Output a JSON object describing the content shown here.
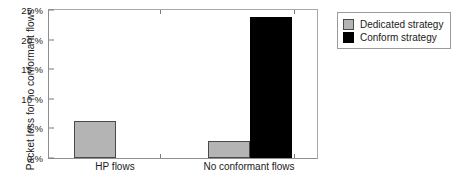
{
  "chart_data": {
    "type": "bar",
    "title": "",
    "xlabel": "",
    "ylabel": "Packet loss for no conformant flows",
    "categories": [
      "HP flows",
      "No conformant flows"
    ],
    "series": [
      {
        "name": "Dedicated strategy",
        "color": "#b4b4b4",
        "values": [
          6.2,
          2.9
        ]
      },
      {
        "name": "Conform strategy",
        "color": "#000000",
        "values": [
          null,
          23.8
        ]
      }
    ],
    "ylim": [
      0,
      25
    ],
    "ytick_values": [
      0,
      5,
      10,
      15,
      20,
      25
    ],
    "ytick_labels": [
      "0 %",
      "5 %",
      "10 %",
      "15 %",
      "20 %",
      "25 %"
    ],
    "grid": false,
    "legend_position": "right-outside",
    "legend_entries": [
      "Dedicated strategy",
      "Conform strategy"
    ]
  }
}
